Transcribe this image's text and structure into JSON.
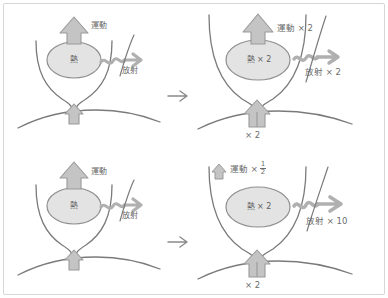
{
  "diagram": {
    "language": "ja",
    "colors": {
      "line": "#7a7a7a",
      "arrow_fill": "#bdbdbd",
      "arrow_stroke": "#9a9a9a",
      "ellipse_fill": "#e3e3e3",
      "text": "#6b6b6b",
      "frame": "#d6d6d6",
      "background": "#ffffff"
    },
    "transition_arrow": "→",
    "labels": {
      "motion": "運動",
      "radiation": "放射",
      "heat": "熱",
      "times": "×",
      "two": "2",
      "ten": "10",
      "half_numerator": "1",
      "half_denominator": "2"
    },
    "panels": [
      {
        "id": "top-left",
        "position": "top-left",
        "heat_label": "熱",
        "motion_label": "運動",
        "radiation_label": "放射",
        "base_label": "",
        "motion_arrow": "large-up-arrow",
        "base_arrow": "single-up-arrow",
        "has_transition_arrow": true
      },
      {
        "id": "top-right",
        "position": "top-right",
        "heat_label": "熱 × 2",
        "motion_label": "運動 × 2",
        "radiation_label": "放射 × 2",
        "base_label": "× 2",
        "motion_arrow": "large-up-arrow",
        "base_arrow": "double-up-arrow",
        "has_transition_arrow": false
      },
      {
        "id": "bottom-left",
        "position": "bottom-left",
        "heat_label": "熱",
        "motion_label": "運動",
        "radiation_label": "放射",
        "base_label": "",
        "motion_arrow": "large-up-arrow",
        "base_arrow": "single-up-arrow",
        "has_transition_arrow": true
      },
      {
        "id": "bottom-right",
        "position": "bottom-right",
        "heat_label": "熱 × 2",
        "motion_label_prefix": "運動 ×",
        "motion_label_fraction_num": "1",
        "motion_label_fraction_den": "2",
        "radiation_label": "放射 × 10",
        "base_label": "× 2",
        "motion_arrow": "small-up-arrow",
        "base_arrow": "double-up-arrow",
        "has_transition_arrow": false
      }
    ]
  }
}
